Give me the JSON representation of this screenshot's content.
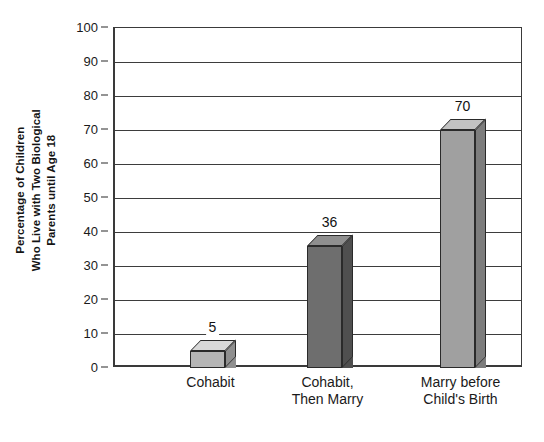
{
  "chart_data": {
    "type": "bar",
    "title": "",
    "subtitle": "",
    "xlabel": "",
    "ylabel": "Percentage of Children Who Live with Two Biological Parents until Age 18",
    "ylabel_lines": [
      "Percentage of Children",
      "Who Live with Two Biological",
      "Parents until Age 18"
    ],
    "categories": [
      "Cohabit",
      "Cohabit, Then Marry",
      "Marry before Child's Birth"
    ],
    "category_label_lines": [
      [
        "Cohabit"
      ],
      [
        "Cohabit,",
        "Then Marry"
      ],
      [
        "Marry before",
        "Child's Birth"
      ]
    ],
    "values": [
      5,
      36,
      70
    ],
    "data_labels": [
      "5",
      "36",
      "70"
    ],
    "ylim": [
      0,
      100
    ],
    "ytick_step": 10,
    "ytick_labels": [
      "100",
      "90",
      "80",
      "70",
      "60",
      "50",
      "40",
      "30",
      "20",
      "10",
      "0"
    ],
    "ytick_values": [
      100,
      90,
      80,
      70,
      60,
      50,
      40,
      30,
      20,
      10,
      0
    ],
    "grid": true,
    "grid_orientation": "horizontal",
    "legend": false,
    "legend_position": "none",
    "bar_style": "3d-block",
    "bar_colors": [
      "#b5b5b5",
      "#6e6e6e",
      "#a0a0a0"
    ],
    "bar_top_colors": [
      "#d8d8d8",
      "#8f8f8f",
      "#c2c2c2"
    ],
    "bar_side_colors": [
      "#8f8f8f",
      "#4f4f4f",
      "#7d7d7d"
    ],
    "axis_color": "#3a3a3a",
    "grid_color": "#3d3d3d",
    "background_color": "#ffffff",
    "text_color": "#1a1a1a"
  }
}
